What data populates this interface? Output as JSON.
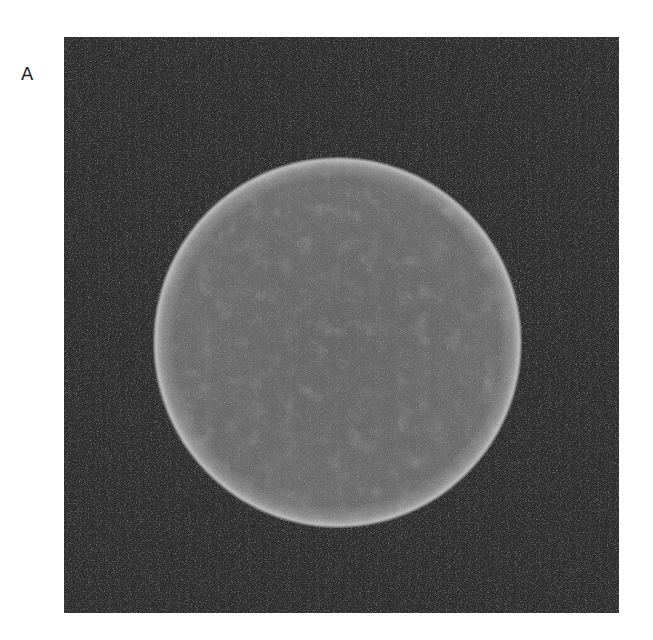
{
  "figure": {
    "panel_label": "A",
    "image": {
      "description": "grayscale circular phantom image on dark noisy background",
      "background_color": "#2e2e2e",
      "disk_fill_color": "#6b6b6b",
      "disk_rim_color": "#b5b5b5"
    }
  }
}
